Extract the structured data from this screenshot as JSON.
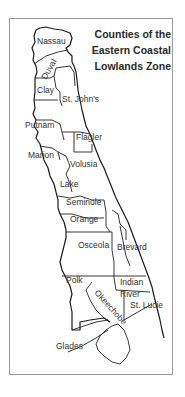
{
  "map": {
    "title_lines": [
      "Counties of the",
      "Eastern Coastal",
      "Lowlands Zone"
    ],
    "counties": [
      {
        "name": "Nassau",
        "x": 37,
        "y": 44
      },
      {
        "name": "Duval",
        "x": 44,
        "y": 75,
        "rotate": -60
      },
      {
        "name": "Clay",
        "x": 37,
        "y": 93
      },
      {
        "name": "St. John's",
        "x": 62,
        "y": 102
      },
      {
        "name": "Putnam",
        "x": 25,
        "y": 128
      },
      {
        "name": "Flagler",
        "x": 76,
        "y": 140
      },
      {
        "name": "Marion",
        "x": 28,
        "y": 158
      },
      {
        "name": "Volusia",
        "x": 70,
        "y": 167
      },
      {
        "name": "Lake",
        "x": 60,
        "y": 187
      },
      {
        "name": "Seminole",
        "x": 66,
        "y": 205
      },
      {
        "name": "Orange",
        "x": 70,
        "y": 222
      },
      {
        "name": "Osceola",
        "x": 78,
        "y": 248
      },
      {
        "name": "Brevard",
        "x": 117,
        "y": 250
      },
      {
        "name": "Polk",
        "x": 66,
        "y": 283
      },
      {
        "name": "Indian",
        "x": 120,
        "y": 285
      },
      {
        "name": "River",
        "x": 120,
        "y": 297
      },
      {
        "name": "Okeechobe",
        "x": 95,
        "y": 296,
        "rotate": 48
      },
      {
        "name": "St. Lucie",
        "x": 130,
        "y": 308
      },
      {
        "name": "Glades",
        "x": 56,
        "y": 349
      }
    ]
  },
  "colors": {
    "line": "#1a1a1a",
    "frame": "#9a9a9a",
    "text": "#333333"
  }
}
